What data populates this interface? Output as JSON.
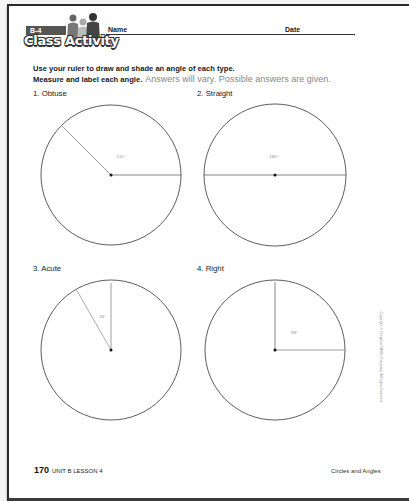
{
  "header": {
    "lesson_tag": "B-4",
    "title": "Class Activity",
    "name_label": "Name",
    "date_label": "Date"
  },
  "instructions": {
    "line1": "Use your ruler to draw and shade an angle of each type.",
    "line2": "Measure and label each angle.",
    "answers_note": "Answers will vary. Possible answers are given."
  },
  "problems": [
    {
      "label": "1. Obtuse",
      "angle_label": "135°",
      "angle_deg": 135
    },
    {
      "label": "2. Straight",
      "angle_label": "180°",
      "angle_deg": 180
    },
    {
      "label": "3. Acute",
      "angle_label": "30°",
      "angle_deg": 30
    },
    {
      "label": "4. Right",
      "angle_label": "90°",
      "angle_deg": 90
    }
  ],
  "footer": {
    "page_number": "170",
    "unit_lesson": "UNIT B LESSON 4",
    "topic": "Circles and Angles"
  },
  "copyright": "Copyright © Houghton Mifflin Company. All rights reserved.",
  "colors": {
    "ink": "#222222",
    "answer_gray": "#888888",
    "tag_bg": "#555555"
  }
}
